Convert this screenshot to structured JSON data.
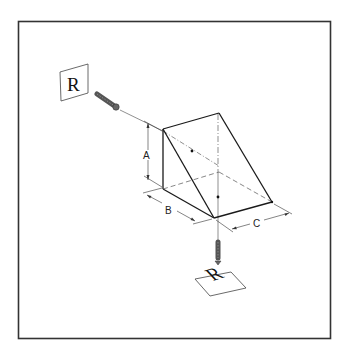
{
  "figure": {
    "frame_color": "#333333",
    "line_color": "#1a1a1a",
    "hidden_line_color": "#555555"
  },
  "labels": {
    "dimension_a": "A",
    "dimension_b": "B",
    "dimension_c": "C",
    "input_image_letter": "R",
    "output_image_letter": "R"
  },
  "icons": {
    "input_beam": "laser-beam-icon",
    "output_beam": "laser-beam-icon",
    "input_image": "image-card-icon",
    "output_image": "image-card-icon"
  }
}
